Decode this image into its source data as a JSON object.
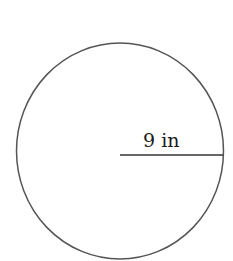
{
  "diagram": {
    "shape": "circle",
    "radius_label": "9 in",
    "colors": {
      "background": "#ffffff",
      "stroke": "#555555",
      "text": "#1a1a1a"
    }
  }
}
